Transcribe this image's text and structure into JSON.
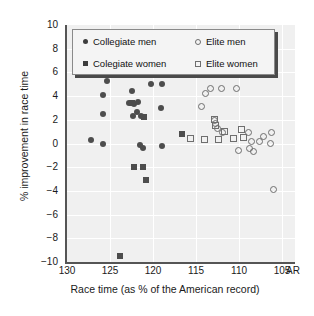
{
  "chart_data": {
    "type": "scatter",
    "title": "",
    "xlabel": "Race time (as % of the American record)",
    "ylabel": "% improvement in race time",
    "xlim": [
      130,
      103.5
    ],
    "ylim": [
      -10,
      10
    ],
    "x_ticks": [
      130,
      125,
      120,
      115,
      110,
      105
    ],
    "x_tick_labels": [
      "130",
      "125",
      "120",
      "115",
      "110",
      "105"
    ],
    "x_axis_end_label": "AR",
    "y_ticks": [
      10,
      8,
      6,
      4,
      2,
      0,
      -2,
      -4,
      -6,
      -8,
      -10
    ],
    "y_tick_labels": [
      "10",
      "8",
      "6",
      "4",
      "2",
      "0",
      "−2",
      "−4",
      "−6",
      "−8",
      "−10"
    ],
    "grid": true,
    "legend_position": "top-left",
    "series": [
      {
        "name": "Collegiate men",
        "marker": "filled-circle",
        "color": "#4d4d4d",
        "points": [
          [
            125.4,
            5.3
          ],
          [
            125.8,
            4.1
          ],
          [
            125.8,
            2.5
          ],
          [
            125.8,
            0.0
          ],
          [
            127.2,
            0.3
          ],
          [
            122.4,
            4.4
          ],
          [
            122.8,
            3.4
          ],
          [
            122.6,
            3.4
          ],
          [
            122.2,
            3.3
          ],
          [
            122.3,
            2.3
          ],
          [
            121.8,
            3.5
          ],
          [
            121.9,
            2.7
          ],
          [
            121.4,
            2.3
          ],
          [
            121.5,
            -0.1
          ],
          [
            121.2,
            -0.4
          ],
          [
            120.2,
            5.0
          ],
          [
            119.0,
            5.0
          ],
          [
            119.1,
            3.0
          ],
          [
            119.0,
            -0.2
          ]
        ]
      },
      {
        "name": "Colegiate women",
        "marker": "filled-square",
        "color": "#4d4d4d",
        "points": [
          [
            122.5,
            3.4
          ],
          [
            121.1,
            2.2
          ],
          [
            122.2,
            -2.0
          ],
          [
            121.2,
            -2.0
          ],
          [
            120.8,
            -3.1
          ],
          [
            116.6,
            0.8
          ],
          [
            123.8,
            -9.5
          ]
        ]
      },
      {
        "name": "Elite men",
        "marker": "open-circle",
        "color": "#6e6e6e",
        "points": [
          [
            113.9,
            4.2
          ],
          [
            113.3,
            4.6
          ],
          [
            112.1,
            4.6
          ],
          [
            110.3,
            4.6
          ],
          [
            114.4,
            3.1
          ],
          [
            112.9,
            1.9
          ],
          [
            112.7,
            1.7
          ],
          [
            112.5,
            1.3
          ],
          [
            111.9,
            0.9
          ],
          [
            110.1,
            -0.6
          ],
          [
            108.9,
            0.9
          ],
          [
            108.6,
            0.2
          ],
          [
            108.8,
            -0.4
          ],
          [
            108.3,
            -0.7
          ],
          [
            107.6,
            0.2
          ],
          [
            107.2,
            0.6
          ],
          [
            106.2,
            0.9
          ],
          [
            106.4,
            0.0
          ],
          [
            106.0,
            -3.9
          ]
        ]
      },
      {
        "name": "Elite women",
        "marker": "open-square",
        "color": "#6e6e6e",
        "points": [
          [
            112.9,
            2.0
          ],
          [
            112.7,
            1.5
          ],
          [
            111.7,
            1.0
          ],
          [
            110.6,
            0.4
          ],
          [
            109.7,
            1.2
          ],
          [
            109.5,
            0.5
          ],
          [
            115.6,
            0.4
          ],
          [
            114.0,
            0.3
          ],
          [
            112.4,
            0.3
          ]
        ]
      }
    ]
  },
  "legend": {
    "entries": [
      {
        "label": "Collegiate men",
        "marker": "filled-circle"
      },
      {
        "label": "Elite men",
        "marker": "open-circle"
      },
      {
        "label": "Colegiate women",
        "marker": "filled-square"
      },
      {
        "label": "Elite women",
        "marker": "open-square"
      }
    ]
  },
  "colors": {
    "plot_background": "#f0f0f0",
    "gridline": "#ffffff",
    "axis": "#555555",
    "filled_marker": "#4d4d4d",
    "open_marker": "#6e6e6e",
    "text": "#1a1a1a"
  }
}
